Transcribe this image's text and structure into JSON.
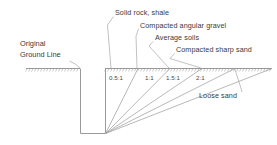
{
  "diagram": {
    "ground_label": {
      "line1": "Original",
      "line2": "Ground Line"
    },
    "soil_labels": [
      {
        "id": "solid-rock-shale",
        "text": "Solid rock, shale",
        "ratio": "0.5:1"
      },
      {
        "id": "compacted-angular-gravel",
        "text": "Compacted angular gravel",
        "ratio": "1:1"
      },
      {
        "id": "average-soils",
        "text": "Average soils",
        "ratio": "1.5:1"
      },
      {
        "id": "compacted-sharp-sand",
        "text": "Compacted sharp sand",
        "ratio": "2:1"
      },
      {
        "id": "loose-sand",
        "text": "Loose sand",
        "ratio": "3:1"
      }
    ],
    "ratio_labels": [
      {
        "id": "ratio-0-5-1",
        "text": "0.5:1"
      },
      {
        "id": "ratio-1-1",
        "text": "1:1"
      },
      {
        "id": "ratio-1-5-1",
        "text": "1.5:1"
      },
      {
        "id": "ratio-2-1",
        "text": "2:1"
      }
    ],
    "colors": {
      "line": "#808080",
      "text": "#3a3a3a",
      "ground_hatch": "#9a9a9a",
      "background": "#ffffff"
    }
  }
}
